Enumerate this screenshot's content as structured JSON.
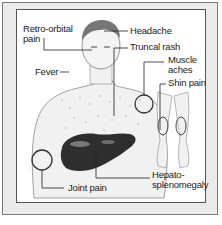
{
  "figure": {
    "labels": {
      "retro_orbital": "Retro-orbital",
      "retro_orbital_2": "pain",
      "headache": "Headache",
      "truncal_rash": "Truncal rash",
      "muscle": "Muscle",
      "aches": "aches",
      "shin_pain": "Shin pain",
      "fever": "Fever",
      "hepato": "Hepato-",
      "splenomegaly": "splenomegaly",
      "joint_pain": "Joint pain"
    },
    "colors": {
      "frame_bg": "#ebebeb",
      "panel_bg": "#ffffff",
      "organ": "#2e2e2e",
      "skin_outline": "#8a8a8a"
    }
  }
}
